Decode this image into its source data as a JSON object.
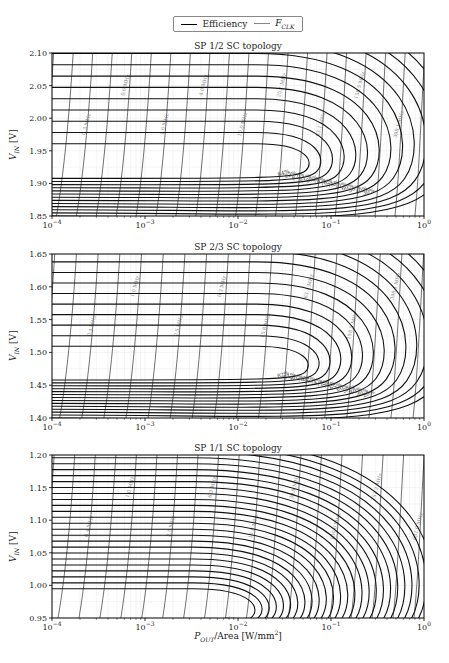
{
  "figure": {
    "legend": {
      "items": [
        {
          "label": "Efficiency",
          "style": "thick-black"
        },
        {
          "label": "F",
          "sub": "CLK",
          "style": "thin-gray"
        }
      ]
    },
    "xlabel_main": "P",
    "xlabel_sub": "OUT",
    "xlabel_rest": "/Area [W/mm",
    "xlabel_sup": "2",
    "xlabel_end": "]",
    "ylabel_main": "V",
    "ylabel_sub": "IN",
    "ylabel_rest": " [V]",
    "xticks": [
      "10",
      "10",
      "10",
      "10",
      "10"
    ],
    "xtick_exps": [
      "−4",
      "−3",
      "−2",
      "−1",
      "0"
    ]
  },
  "chart_data": [
    {
      "type": "contour",
      "title": "SP 1/2 SC topology",
      "xlabel": "P_OUT/Area [W/mm^2]",
      "ylabel": "V_IN [V]",
      "xscale": "log",
      "xlim": [
        0.0001,
        1
      ],
      "ylim": [
        1.85,
        2.1
      ],
      "yticks": [
        "1.85",
        "1.90",
        "1.95",
        "2.00",
        "2.05",
        "2.10"
      ],
      "grid": true,
      "efficiency_contours": [
        "84%",
        "83%",
        "82%",
        "81%",
        "80%",
        "78%",
        "76%",
        "75%",
        "70%",
        "60%",
        "50%",
        "40%",
        "30%"
      ],
      "fclk_contours": [
        "0.1 MHz",
        "0.2 MHz",
        "0.3 MHz",
        "0.4 MHz",
        "0.6 MHz",
        "1.0 MHz",
        "1.6 MHz",
        "2.5 MHz",
        "4.0 MHz",
        "6.3 MHz",
        "10.0 MHz",
        "15.8 MHz",
        "25.1 MHz",
        "39.8 MHz",
        "63.1 MHz",
        "100.0 MHz",
        "158.5 MHz",
        "251.2 MHz",
        "398.1 MHz",
        "631.0 MHz"
      ]
    },
    {
      "type": "contour",
      "title": "SP 2/3 SC topology",
      "xlabel": "P_OUT/Area [W/mm^2]",
      "ylabel": "V_IN [V]",
      "xscale": "log",
      "xlim": [
        0.0001,
        1
      ],
      "ylim": [
        1.4,
        1.65
      ],
      "yticks": [
        "1.40",
        "1.45",
        "1.50",
        "1.55",
        "1.60",
        "1.65"
      ],
      "grid": true,
      "efficiency_contours": [
        "82%",
        "81%",
        "80%",
        "78%",
        "76%",
        "74%",
        "72%",
        "70%",
        "65%",
        "60%",
        "50%",
        "40%",
        "30%",
        "20%"
      ],
      "fclk_contours": [
        "0.1 MHz",
        "0.2 MHz",
        "0.4 MHz",
        "0.6 MHz",
        "1.0 MHz",
        "1.6 MHz",
        "2.5 MHz",
        "4.0 MHz",
        "6.3 MHz",
        "10.0 MHz",
        "15.8 MHz",
        "39.8 MHz",
        "63.1 MHz",
        "100.0 MHz",
        "158.5 MHz",
        "251.2 MHz",
        "398.1 MHz",
        "631.0 MHz"
      ]
    },
    {
      "type": "contour",
      "title": "SP 1/1 SC topology",
      "xlabel": "P_OUT/Area [W/mm^2]",
      "ylabel": "V_IN [V]",
      "xscale": "log",
      "xlim": [
        0.0001,
        1
      ],
      "ylim": [
        0.95,
        1.2
      ],
      "yticks": [
        "0.95",
        "1.00",
        "1.05",
        "1.10",
        "1.15",
        "1.20"
      ],
      "grid": true,
      "efficiency_contours": [
        "94%",
        "93%",
        "92%",
        "91%",
        "90%",
        "89%",
        "88%",
        "87%",
        "86%",
        "85%",
        "84%",
        "82%",
        "80%",
        "78%",
        "76%",
        "74%",
        "72%",
        "70%",
        "65%",
        "60%",
        "50%",
        "40%",
        "35%",
        "30%",
        "20%",
        "10%"
      ],
      "fclk_contours": [
        "0.1 MHz",
        "0.2 MHz",
        "0.4 MHz",
        "0.6 MHz",
        "1.0 MHz",
        "1.6 MHz",
        "2.5 MHz",
        "4.0 MHz",
        "6.3 MHz",
        "10.0 MHz",
        "15.8 MHz",
        "25.1 MHz",
        "39.8 MHz",
        "63.1 MHz",
        "100.0 MHz",
        "158.5 MHz",
        "251.2 MHz",
        "398.1 MHz",
        "631.0 MHz"
      ]
    }
  ]
}
